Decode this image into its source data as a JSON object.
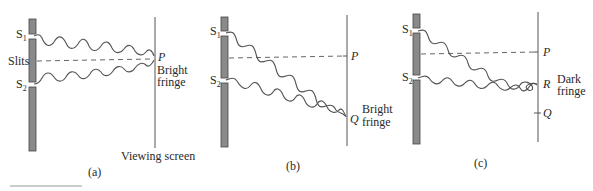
{
  "figure": {
    "panels": [
      {
        "id": "a",
        "caption": "(a)",
        "labels": {
          "s1": "S",
          "s1_sub": "1",
          "s2": "S",
          "s2_sub": "2",
          "slits": "Slits",
          "point": "P",
          "fringe_line1": "Bright",
          "fringe_line2": "fringe",
          "screen": "Viewing screen"
        }
      },
      {
        "id": "b",
        "caption": "(b)",
        "labels": {
          "s1": "S",
          "s1_sub": "1",
          "s2": "S",
          "s2_sub": "2",
          "point_p": "P",
          "point_q": "Q",
          "fringe_line1": "Bright",
          "fringe_line2": "fringe"
        }
      },
      {
        "id": "c",
        "caption": "(c)",
        "labels": {
          "s1": "S",
          "s1_sub": "1",
          "s2": "S",
          "s2_sub": "2",
          "point_p": "P",
          "point_r": "R",
          "point_q": "Q",
          "fringe_line1": "Dark",
          "fringe_line2": "fringe"
        }
      }
    ],
    "colors": {
      "barrier": "#8a8a8a",
      "lines": "#555555",
      "text": "#2a2a2a"
    }
  }
}
